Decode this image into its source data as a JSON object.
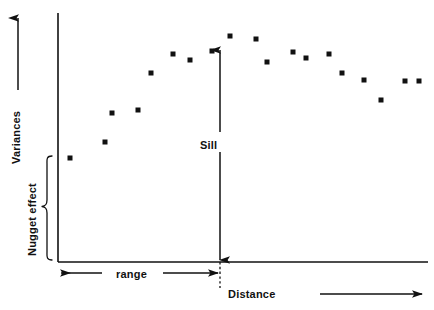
{
  "figure": {
    "background_color": "#ffffff",
    "ink_color": "#111111",
    "width": 434,
    "height": 310
  },
  "labels": {
    "y_axis": "Variances",
    "x_axis": "Distance",
    "sill": "Sill",
    "range": "range",
    "nugget_effect": "Nugget effect"
  },
  "annotations": {
    "y_axis_arrow": "upward-arrow",
    "x_axis_arrow": "rightward-arrow",
    "sill_arrow": "double-headed-vertical-arrow",
    "range_arrow": "double-headed-horizontal-arrow",
    "nugget_brace": "left-curly-brace",
    "range_marker": "vertical-dotted-line"
  },
  "chart_data": {
    "type": "scatter",
    "title": "",
    "subtitle": "",
    "xlabel": "Distance",
    "ylabel": "Variances",
    "grid": false,
    "legend": "none",
    "axis": {
      "origin_px": [
        58,
        262
      ],
      "y_top_px": 13,
      "x_right_px": 428,
      "xlim": [
        0,
        100
      ],
      "ylim": [
        0,
        100
      ]
    },
    "annotation_values": {
      "nugget_effect_top_frac": 0.404,
      "nugget_effect_bottom_frac": 0.0,
      "sill_top_frac": 0.856,
      "sill_bottom_frac": 0.0,
      "range_x_frac": 0.438,
      "range_start_x_frac": 0.0
    },
    "points_px": [
      [
        70,
        158
      ],
      [
        105,
        142
      ],
      [
        112,
        113
      ],
      [
        138,
        110
      ],
      [
        151,
        73
      ],
      [
        173,
        54
      ],
      [
        190,
        60
      ],
      [
        212,
        51
      ],
      [
        230,
        36
      ],
      [
        256,
        39
      ],
      [
        267,
        62
      ],
      [
        293,
        52
      ],
      [
        306,
        58
      ],
      [
        329,
        54
      ],
      [
        342,
        73
      ],
      [
        364,
        80
      ],
      [
        381,
        100
      ],
      [
        405,
        81
      ],
      [
        419,
        81
      ]
    ],
    "x": [
      3.2,
      12.7,
      14.5,
      21.6,
      25.1,
      31.0,
      35.6,
      41.6,
      46.5,
      53.5,
      56.5,
      63.5,
      66.8,
      73.0,
      76.5,
      82.5,
      87.1,
      93.6,
      97.4
    ],
    "values": [
      41.8,
      48.2,
      59.8,
      61.0,
      75.9,
      83.5,
      81.1,
      84.7,
      90.8,
      89.6,
      80.3,
      84.3,
      82.0,
      83.5,
      75.9,
      73.1,
      65.1,
      72.7,
      72.7
    ],
    "series": [
      {
        "name": "experimental semivariogram",
        "marker": "filled-square",
        "marker_size_px": 5
      }
    ]
  }
}
